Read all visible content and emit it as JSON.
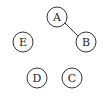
{
  "graph": {
    "nodes": [
      {
        "id": "A",
        "label": "A",
        "x": 57,
        "y": 17
      },
      {
        "id": "B",
        "label": "B",
        "x": 86,
        "y": 42
      },
      {
        "id": "C",
        "label": "C",
        "x": 72,
        "y": 78
      },
      {
        "id": "D",
        "label": "D",
        "x": 37,
        "y": 78
      },
      {
        "id": "E",
        "label": "E",
        "x": 23,
        "y": 42
      }
    ],
    "edges": [
      {
        "from": "A",
        "to": "B"
      }
    ],
    "node_radius": 10
  }
}
